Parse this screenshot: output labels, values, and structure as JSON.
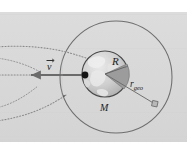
{
  "figure": {
    "name": "geostationary-orbit-diagram",
    "background_top_band": "#ffffff",
    "background_plate": "#d9d9d9",
    "labels": {
      "velocity": "v",
      "earth_radius": "R",
      "earth_mass": "M",
      "geo_radius_base": "r",
      "geo_radius_sub": "geo"
    },
    "colors": {
      "plate": "#d9d9d9",
      "orbit_stroke": "#6e6e6e",
      "earth_stroke": "#4a4a4a",
      "earth_fill": "#c2c2c2",
      "earth_land": "#e6e6e6",
      "wedge_fill": "#9a9a9a",
      "vector_stroke": "#6b6b6b",
      "dot_fill": "#141414",
      "trajectory_stroke": "#8a8a8a",
      "satellite_fill": "#b8b8b8",
      "label_color": "#1c1c1c"
    },
    "geometry": {
      "orbit_center_x": 116,
      "orbit_center_y": 77,
      "orbit_radius": 56,
      "earth_center_x": 105,
      "earth_center_y": 74,
      "earth_radius": 23,
      "focus_dot_x": 85,
      "focus_dot_y": 75,
      "satellite_x": 155,
      "satellite_y": 104
    },
    "elements": {
      "outer_orbit": "geostationary-orbit-circle",
      "earth_body": "earth-sphere",
      "radius_wedge": "earth-radius-wedge",
      "velocity_arrow": "velocity-vector-arrow",
      "geo_radius_line": "geo-radius-line",
      "satellite": "satellite-marker",
      "trajectories": [
        "trajectory-upper-dotted",
        "trajectory-middle-dotted",
        "trajectory-lower-dotted"
      ]
    }
  }
}
